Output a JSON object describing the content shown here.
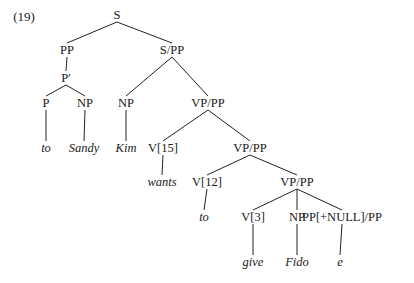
{
  "example_number": "(19)",
  "tree": {
    "nodes": [
      {
        "id": "S",
        "label": "S",
        "x": 117,
        "y": 15,
        "leaf": false
      },
      {
        "id": "PP",
        "label": "PP",
        "x": 67,
        "y": 50,
        "leaf": false
      },
      {
        "id": "SPP",
        "label": "S/PP",
        "x": 172,
        "y": 50,
        "leaf": false
      },
      {
        "id": "Pbar",
        "label": "P′",
        "x": 66,
        "y": 78,
        "leaf": false
      },
      {
        "id": "P",
        "label": "P",
        "x": 46,
        "y": 103,
        "leaf": false
      },
      {
        "id": "NP1",
        "label": "NP",
        "x": 85,
        "y": 103,
        "leaf": false
      },
      {
        "id": "NP2",
        "label": "NP",
        "x": 126,
        "y": 103,
        "leaf": false
      },
      {
        "id": "VPPP1",
        "label": "VP/PP",
        "x": 208,
        "y": 103,
        "leaf": false
      },
      {
        "id": "w_to1",
        "label": "to",
        "x": 46,
        "y": 148,
        "leaf": true
      },
      {
        "id": "w_sandy",
        "label": "Sandy",
        "x": 84,
        "y": 148,
        "leaf": true
      },
      {
        "id": "w_kim",
        "label": "Kim",
        "x": 126,
        "y": 148,
        "leaf": true
      },
      {
        "id": "V15",
        "label": "V[15]",
        "x": 163,
        "y": 148,
        "leaf": false
      },
      {
        "id": "VPPP2",
        "label": "VP/PP",
        "x": 250,
        "y": 148,
        "leaf": false
      },
      {
        "id": "w_wants",
        "label": "wants",
        "x": 162,
        "y": 182,
        "leaf": true
      },
      {
        "id": "V12",
        "label": "V[12]",
        "x": 207,
        "y": 182,
        "leaf": false
      },
      {
        "id": "VPPP3",
        "label": "VP/PP",
        "x": 297,
        "y": 182,
        "leaf": false
      },
      {
        "id": "w_to2",
        "label": "to",
        "x": 204,
        "y": 217,
        "leaf": true
      },
      {
        "id": "V3",
        "label": "V[3]",
        "x": 253,
        "y": 217,
        "leaf": false
      },
      {
        "id": "NP3",
        "label": "NP",
        "x": 297,
        "y": 217,
        "leaf": false
      },
      {
        "id": "PPNULL",
        "label": "PP[+NULL]/PP",
        "x": 342,
        "y": 217,
        "leaf": false
      },
      {
        "id": "w_give",
        "label": "give",
        "x": 253,
        "y": 262,
        "leaf": true
      },
      {
        "id": "w_fido",
        "label": "Fido",
        "x": 297,
        "y": 262,
        "leaf": true
      },
      {
        "id": "w_e",
        "label": "e",
        "x": 340,
        "y": 262,
        "leaf": true
      }
    ],
    "edges": [
      [
        "S",
        "PP"
      ],
      [
        "S",
        "SPP"
      ],
      [
        "PP",
        "Pbar"
      ],
      [
        "Pbar",
        "P"
      ],
      [
        "Pbar",
        "NP1"
      ],
      [
        "P",
        "w_to1"
      ],
      [
        "NP1",
        "w_sandy"
      ],
      [
        "SPP",
        "NP2"
      ],
      [
        "SPP",
        "VPPP1"
      ],
      [
        "NP2",
        "w_kim"
      ],
      [
        "VPPP1",
        "V15"
      ],
      [
        "VPPP1",
        "VPPP2"
      ],
      [
        "V15",
        "w_wants"
      ],
      [
        "VPPP2",
        "V12"
      ],
      [
        "VPPP2",
        "VPPP3"
      ],
      [
        "V12",
        "w_to2"
      ],
      [
        "VPPP3",
        "V3"
      ],
      [
        "VPPP3",
        "NP3"
      ],
      [
        "VPPP3",
        "PPNULL"
      ],
      [
        "V3",
        "w_give"
      ],
      [
        "NP3",
        "w_fido"
      ],
      [
        "PPNULL",
        "w_e"
      ]
    ]
  }
}
